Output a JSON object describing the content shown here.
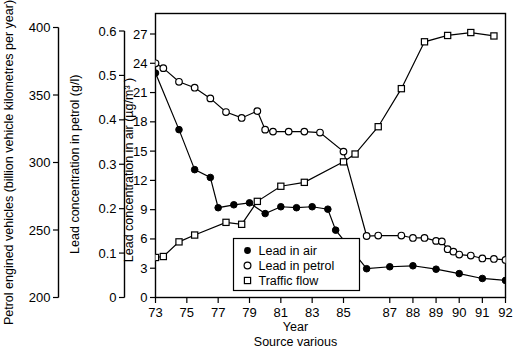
{
  "chart_data": {
    "type": "line",
    "title": "",
    "xlabel": "Year",
    "source_note": "Source various",
    "grid": false,
    "legend_position": "inside-bottom-center",
    "x": [
      73,
      73.5,
      74.5,
      75.5,
      76.5,
      77,
      77.5,
      78,
      78.5,
      79,
      79.5,
      80,
      80.5,
      81,
      81.5,
      82,
      82.5,
      83,
      83.5,
      84,
      84.5,
      85,
      85.5,
      86,
      86.5,
      87,
      87.5,
      88,
      88.5,
      89,
      89.25,
      89.5,
      89.75,
      90,
      90.25,
      90.5,
      90.75,
      91,
      91.25,
      91.5,
      91.75,
      92
    ],
    "xticks": [
      73,
      75,
      77,
      79,
      81,
      83,
      85,
      87,
      88,
      89,
      90,
      91,
      92
    ],
    "xticklabels": [
      "73",
      "75",
      "77",
      "79",
      "81",
      "83",
      "85",
      "87",
      "88",
      "89",
      "90",
      "91",
      "92"
    ],
    "axes": [
      {
        "id": "petrol-vehicles",
        "label": "Petrol engined vehicles (billion vehicle kilometres per year)",
        "ticks": [
          200,
          250,
          300,
          350,
          400
        ],
        "ticklabels": [
          "200",
          "250",
          "300",
          "350",
          "400"
        ],
        "lim": [
          200,
          400
        ]
      },
      {
        "id": "lead-in-petrol",
        "label": "Lead concentration in petrol (g/l)",
        "ticks": [
          0,
          0.1,
          0.2,
          0.3,
          0.4,
          0.5,
          0.6
        ],
        "ticklabels": [
          "0",
          "0.1",
          "0.2",
          "0.3",
          "0.4",
          "0.5",
          "0.6"
        ],
        "lim": [
          0,
          0.6
        ]
      },
      {
        "id": "lead-in-air",
        "label": "Lead concentration in air (µg/m³ )",
        "ticks": [
          0,
          3,
          6,
          9,
          12,
          15,
          18,
          21,
          24,
          27
        ],
        "ticklabels": [
          "0",
          "3",
          "6",
          "9",
          "12",
          "15",
          "18",
          "21",
          "24",
          "27"
        ],
        "lim": [
          0,
          28.5
        ]
      }
    ],
    "series": [
      {
        "name": "Lead in air",
        "marker": "filled-circle",
        "unit": "µg/m³",
        "points": [
          [
            73,
            23.0
          ],
          [
            74.5,
            17.2
          ],
          [
            75.5,
            13.1
          ],
          [
            76.5,
            12.3
          ],
          [
            77,
            9.2
          ],
          [
            78,
            9.5
          ],
          [
            79,
            9.7
          ],
          [
            80,
            8.6
          ],
          [
            81,
            9.3
          ],
          [
            82,
            9.2
          ],
          [
            83,
            9.3
          ],
          [
            84,
            9.05
          ],
          [
            84.5,
            6.9
          ],
          [
            86,
            2.95
          ],
          [
            87,
            3.15
          ],
          [
            88,
            3.25
          ],
          [
            89,
            2.9
          ],
          [
            90,
            2.45
          ],
          [
            91,
            1.95
          ],
          [
            92,
            1.75
          ]
        ]
      },
      {
        "name": "Lead in petrol",
        "marker": "open-circle",
        "unit": "g/l",
        "points": [
          [
            73,
            24.0
          ],
          [
            73.5,
            23.5
          ],
          [
            74.5,
            22.1
          ],
          [
            75.5,
            21.5
          ],
          [
            76.5,
            20.4
          ],
          [
            77.5,
            19.0
          ],
          [
            78.5,
            18.4
          ],
          [
            79.5,
            19.1
          ],
          [
            80,
            17.2
          ],
          [
            80.5,
            17.0
          ],
          [
            81.5,
            17.0
          ],
          [
            82.5,
            17.0
          ],
          [
            83.5,
            16.9
          ],
          [
            85,
            14.95
          ],
          [
            86,
            6.3
          ],
          [
            86.5,
            6.35
          ],
          [
            87.5,
            6.35
          ],
          [
            88,
            6.1
          ],
          [
            88.5,
            6.1
          ],
          [
            89,
            5.8
          ],
          [
            89.25,
            5.75
          ],
          [
            89.5,
            4.95
          ],
          [
            89.75,
            4.7
          ],
          [
            90,
            4.4
          ],
          [
            90.5,
            4.3
          ],
          [
            91,
            4.0
          ],
          [
            91.5,
            3.95
          ],
          [
            92,
            3.85
          ]
        ]
      },
      {
        "name": "Traffic flow",
        "marker": "open-square",
        "unit": "billion vehicle km/year",
        "points": [
          [
            73,
            4.1
          ],
          [
            73.5,
            4.2
          ],
          [
            74.5,
            5.7
          ],
          [
            75.5,
            6.4
          ],
          [
            77.5,
            7.7
          ],
          [
            78.5,
            7.5
          ],
          [
            79.5,
            9.85
          ],
          [
            81,
            11.4
          ],
          [
            82.5,
            11.8
          ],
          [
            85,
            13.9
          ],
          [
            85.5,
            14.7
          ],
          [
            86.5,
            17.5
          ],
          [
            87.5,
            21.4
          ],
          [
            88.5,
            26.2
          ],
          [
            89.5,
            26.85
          ],
          [
            90.5,
            27.15
          ],
          [
            91.5,
            26.8
          ]
        ]
      }
    ]
  },
  "legend": {
    "items": [
      {
        "label": "Lead in air",
        "marker": "filled-circle"
      },
      {
        "label": "Lead in petrol",
        "marker": "open-circle"
      },
      {
        "label": "Traffic flow",
        "marker": "open-square"
      }
    ]
  }
}
